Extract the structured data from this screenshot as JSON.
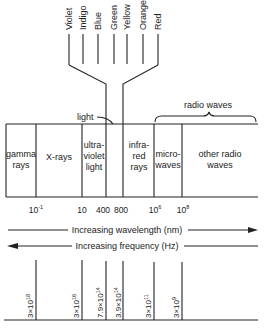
{
  "visible_colors": [
    "Violet",
    "Indigo",
    "Blue",
    "Green",
    "Yellow",
    "Orange",
    "Red"
  ],
  "light_label": "light",
  "radio_waves_label": "radio waves",
  "regions": [
    {
      "id": "gamma",
      "lines": [
        "gamma",
        "rays"
      ]
    },
    {
      "id": "xrays",
      "lines": [
        "X-rays"
      ]
    },
    {
      "id": "uv",
      "lines": [
        "ultra-",
        "violet",
        "light"
      ]
    },
    {
      "id": "visible",
      "lines": []
    },
    {
      "id": "infrared",
      "lines": [
        "infra-",
        "red",
        "rays"
      ]
    },
    {
      "id": "microwaves",
      "lines": [
        "micro-",
        "waves"
      ]
    },
    {
      "id": "other_radio",
      "lines": [
        "other radio",
        "waves"
      ]
    }
  ],
  "wavelength_ticks": [
    {
      "base": "10",
      "exp": "-1"
    },
    {
      "base": "10",
      "exp": ""
    },
    {
      "base": "400",
      "exp": ""
    },
    {
      "base": "800",
      "exp": ""
    },
    {
      "base": "10",
      "exp": "6"
    },
    {
      "base": "10",
      "exp": "8"
    }
  ],
  "wavelength_axis_label": "Increasing wavelength (nm)",
  "frequency_axis_label": "Increasing frequency (Hz)",
  "frequency_ticks": [
    {
      "mant": "3×10",
      "exp": "18"
    },
    {
      "mant": "3×10",
      "exp": "16"
    },
    {
      "mant": "7.9×10",
      "exp": "14"
    },
    {
      "mant": "3.9×10",
      "exp": "14"
    },
    {
      "mant": "3×10",
      "exp": "11"
    },
    {
      "mant": "3×10",
      "exp": "9"
    }
  ],
  "colors": {
    "ink": "#222222",
    "background": "#ffffff"
  }
}
